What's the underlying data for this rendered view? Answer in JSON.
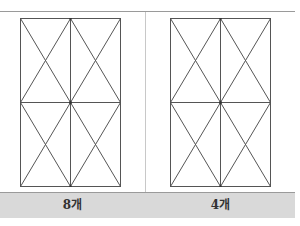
{
  "table": {
    "cells": [
      {
        "figure": "rectangle-2x2-grid-with-diagonals",
        "label": "8개"
      },
      {
        "figure": "rectangle-2x2-grid-with-diagonals",
        "label": "4개"
      }
    ]
  },
  "colors": {
    "line": "#555555",
    "label_bg": "#d9d9d9",
    "border": "#9a9a9a"
  }
}
